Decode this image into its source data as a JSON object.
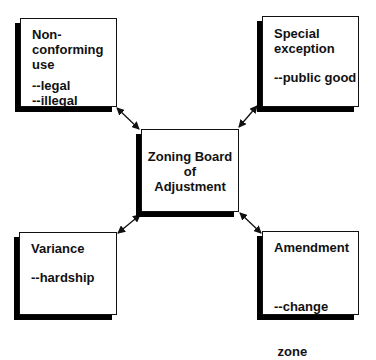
{
  "diagram": {
    "center": {
      "lines": [
        "Zoning Board",
        "of",
        "Adjustment"
      ]
    },
    "nodes": [
      {
        "id": "nonconforming",
        "title_lines": [
          "Non-",
          "conforming",
          "use"
        ],
        "sub_lines": [
          "--legal",
          "--illegal"
        ]
      },
      {
        "id": "special",
        "title_lines": [
          "Special",
          "exception"
        ],
        "sub_lines": [
          "--public good"
        ]
      },
      {
        "id": "variance",
        "title_lines": [
          "Variance"
        ],
        "sub_lines": [
          "--hardship"
        ]
      },
      {
        "id": "amendment",
        "title_lines": [
          "Amendment"
        ],
        "sub_lines": [
          "--change",
          " zone"
        ]
      }
    ],
    "edges": [
      {
        "from": "center",
        "to": "nonconforming",
        "style": "bidirectional"
      },
      {
        "from": "center",
        "to": "special",
        "style": "bidirectional"
      },
      {
        "from": "center",
        "to": "variance",
        "style": "bidirectional"
      },
      {
        "from": "center",
        "to": "amendment",
        "style": "bidirectional"
      }
    ],
    "colors": {
      "line": "#111111",
      "shadow": "#000000",
      "background": "#ffffff"
    }
  }
}
